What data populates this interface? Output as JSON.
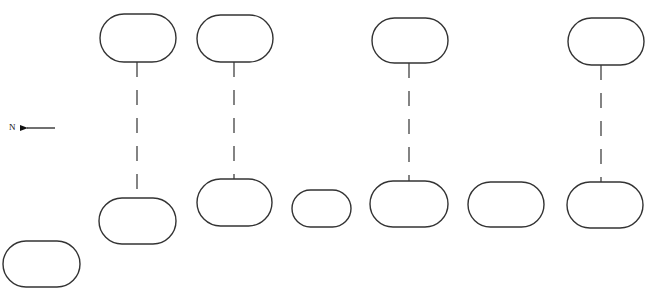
{
  "diagram": {
    "type": "layout-sketch",
    "stroke_color": "#333333",
    "background": "#ffffff",
    "compass": {
      "label": "N",
      "direction": "left",
      "label_pos": [
        9,
        130
      ],
      "arrow": {
        "x1": 55,
        "y1": 128,
        "x2": 19,
        "y2": 128
      }
    },
    "top_shapes": [
      {
        "id": "top-1",
        "cx": 138,
        "cy": 38,
        "rx": 38,
        "ry": 24
      },
      {
        "id": "top-2",
        "cx": 235,
        "cy": 38.5,
        "rx": 38,
        "ry": 23.5
      },
      {
        "id": "top-3",
        "cx": 410,
        "cy": 40.5,
        "rx": 38,
        "ry": 22.5
      },
      {
        "id": "top-4",
        "cx": 606,
        "cy": 41.5,
        "rx": 38,
        "ry": 23.5
      }
    ],
    "bottom_shapes": [
      {
        "id": "bottom-0",
        "cx": 41.5,
        "cy": 264,
        "rx": 38.5,
        "ry": 23
      },
      {
        "id": "bottom-1",
        "cx": 137.5,
        "cy": 221,
        "rx": 38.5,
        "ry": 23
      },
      {
        "id": "bottom-2",
        "cx": 234.5,
        "cy": 202.5,
        "rx": 37.5,
        "ry": 23.5
      },
      {
        "id": "bottom-3",
        "cx": 321.5,
        "cy": 208.5,
        "rx": 29.5,
        "ry": 18.5
      },
      {
        "id": "bottom-4",
        "cx": 409,
        "cy": 204,
        "rx": 39,
        "ry": 23
      },
      {
        "id": "bottom-5",
        "cx": 506,
        "cy": 204.5,
        "rx": 38,
        "ry": 22.5
      },
      {
        "id": "bottom-6",
        "cx": 605,
        "cy": 205,
        "rx": 38,
        "ry": 23
      }
    ],
    "connectors": [
      {
        "id": "link-1",
        "x": 137,
        "y1": 62,
        "y2": 198
      },
      {
        "id": "link-2",
        "x": 234,
        "y1": 62,
        "y2": 179
      },
      {
        "id": "link-3",
        "x": 409,
        "y1": 63,
        "y2": 181
      },
      {
        "id": "link-4",
        "x": 601,
        "y1": 65,
        "y2": 182
      }
    ],
    "connector_dash": "15 13"
  }
}
